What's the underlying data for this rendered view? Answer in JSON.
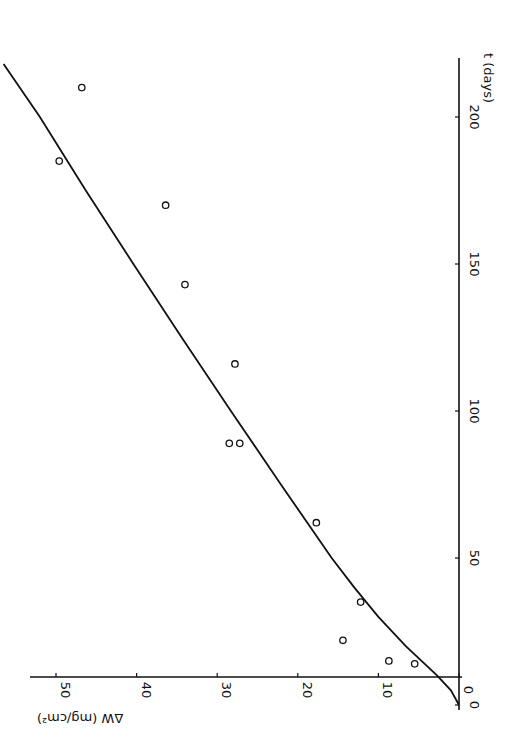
{
  "chart_data": {
    "type": "scatter",
    "title": "",
    "orientation": "rotated 90° (time axis drawn vertically on right, ΔW axis horizontally at bottom, read with page turned)",
    "xlabel": "t (days)",
    "ylabel": "ΔW (mg/cm²)",
    "xlim": [
      0,
      220
    ],
    "ylim": [
      0,
      52
    ],
    "x_ticks": [
      0,
      50,
      100,
      150,
      200
    ],
    "x_tick_labels": [
      "0",
      "50",
      "100",
      "150",
      "200"
    ],
    "y_ticks": [
      0,
      10,
      20,
      30,
      40,
      50
    ],
    "y_tick_labels": [
      "0",
      "10",
      "20",
      "30",
      "40",
      "50"
    ],
    "grid": false,
    "legend": null,
    "series": [
      {
        "name": "measured",
        "marker": "open-circle",
        "points": [
          {
            "t": 14,
            "dw": 5.5
          },
          {
            "t": 15,
            "dw": 8.7
          },
          {
            "t": 22,
            "dw": 14.4
          },
          {
            "t": 35,
            "dw": 12.2
          },
          {
            "t": 62,
            "dw": 17.7
          },
          {
            "t": 89,
            "dw": 27.2
          },
          {
            "t": 89,
            "dw": 28.5
          },
          {
            "t": 116,
            "dw": 27.8
          },
          {
            "t": 143,
            "dw": 34.0
          },
          {
            "t": 170,
            "dw": 36.4
          },
          {
            "t": 185,
            "dw": 49.6
          },
          {
            "t": 210,
            "dw": 46.8
          }
        ]
      },
      {
        "name": "fit",
        "marker": "line",
        "description": "parabolic start transitioning to linear growth",
        "points": [
          {
            "t": 0,
            "dw": 0
          },
          {
            "t": 5,
            "dw": 1.0
          },
          {
            "t": 10,
            "dw": 2.7
          },
          {
            "t": 20,
            "dw": 6.6
          },
          {
            "t": 30,
            "dw": 10.0
          },
          {
            "t": 40,
            "dw": 13.0
          },
          {
            "t": 50,
            "dw": 15.8
          },
          {
            "t": 75,
            "dw": 22.1
          },
          {
            "t": 100,
            "dw": 28.3
          },
          {
            "t": 125,
            "dw": 34.4
          },
          {
            "t": 150,
            "dw": 40.4
          },
          {
            "t": 175,
            "dw": 46.3
          },
          {
            "t": 200,
            "dw": 52.0
          },
          {
            "t": 218,
            "dw": 56.5
          }
        ]
      }
    ]
  },
  "axes": {
    "time_axis": {
      "label": "t (days)",
      "ticks": [
        "0",
        "50",
        "100",
        "150",
        "200"
      ]
    },
    "weight_axis": {
      "label": "ΔW (mg/cm²)",
      "ticks": [
        "0",
        "10",
        "20",
        "30",
        "40",
        "50"
      ]
    }
  },
  "colors": {
    "ink": "#111111",
    "background": "#ffffff"
  }
}
